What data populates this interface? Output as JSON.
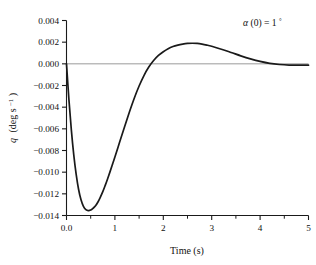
{
  "chart_data": {
    "type": "line",
    "title": "",
    "xlabel": "Time (s)",
    "ylabel": "q (deg s⁻¹)",
    "ylabel_parts": {
      "symbol": "q",
      "units": "(deg s",
      "exponent": "−1",
      "close": ")"
    },
    "annotation": "α(0) = 1°",
    "annotation_parts": {
      "symbol": "α",
      "arg": "(0) = 1",
      "degree": "°"
    },
    "xlim": [
      0,
      5
    ],
    "ylim": [
      -0.014,
      0.004
    ],
    "grid": false,
    "legend": null,
    "x_major_ticks": [
      0,
      1,
      2,
      3,
      4,
      5
    ],
    "x_tick_labels": [
      "0.0",
      "1",
      "2",
      "3",
      "4",
      "5"
    ],
    "x_minor_ticks": [
      0.5,
      1.5,
      2.5,
      3.5,
      4.5
    ],
    "y_major_ticks": [
      0.004,
      0.002,
      0.0,
      -0.002,
      -0.004,
      -0.006,
      -0.008,
      -0.01,
      -0.012,
      -0.014
    ],
    "y_tick_labels": [
      "0.004",
      "0.002",
      "0.000",
      "−0.002",
      "−0.004",
      "−0.006",
      "−0.008",
      "−0.010",
      "−0.012",
      "−0.014"
    ],
    "zero_line": 0.0,
    "features": {
      "start_point": [
        0,
        0
      ],
      "minimum": [
        0.54,
        -0.0133
      ],
      "zero_crossing": [
        1.78,
        0
      ],
      "maximum": [
        2.56,
        0.0019
      ],
      "settles_near": [
        4.3,
        -0.0001
      ]
    },
    "series": [
      {
        "name": "q",
        "color": "#1a1a1a",
        "x": [
          0.0,
          0.05,
          0.1,
          0.15,
          0.2,
          0.25,
          0.3,
          0.35,
          0.4,
          0.45,
          0.5,
          0.55,
          0.6,
          0.65,
          0.7,
          0.75,
          0.8,
          0.85,
          0.9,
          0.95,
          1.0,
          1.1,
          1.2,
          1.3,
          1.4,
          1.5,
          1.6,
          1.7,
          1.8,
          1.9,
          2.0,
          2.1,
          2.2,
          2.3,
          2.4,
          2.5,
          2.6,
          2.7,
          2.8,
          2.9,
          3.0,
          3.2,
          3.4,
          3.6,
          3.8,
          4.0,
          4.2,
          4.4,
          4.6,
          4.8,
          5.0
        ],
        "y": [
          0.0,
          -0.0033,
          -0.0061,
          -0.0084,
          -0.0102,
          -0.0116,
          -0.01255,
          -0.01315,
          -0.01345,
          -0.01355,
          -0.0135,
          -0.01333,
          -0.0131,
          -0.01275,
          -0.0123,
          -0.0118,
          -0.01122,
          -0.0106,
          -0.00995,
          -0.00928,
          -0.0086,
          -0.0072,
          -0.0058,
          -0.00445,
          -0.00318,
          -0.00205,
          -0.00108,
          -0.0003,
          0.0003,
          0.00077,
          0.00112,
          0.0014,
          0.0016,
          0.00173,
          0.00182,
          0.00188,
          0.0019,
          0.00188,
          0.00182,
          0.00173,
          0.00162,
          0.00135,
          0.00105,
          0.00074,
          0.00046,
          0.00022,
          4e-05,
          -6e-05,
          -0.00011,
          -0.00012,
          -0.00012
        ]
      }
    ]
  },
  "figure": {
    "background": "#ffffff",
    "axis_color": "#1a1a1a",
    "zero_line_color": "#9a9a9a",
    "curve_color": "#1a1a1a"
  }
}
